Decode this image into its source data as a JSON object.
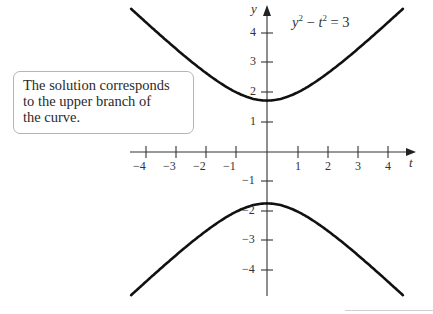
{
  "callout": {
    "lines": [
      "The solution corresponds",
      "to the upper branch of",
      "the curve."
    ]
  },
  "equation": {
    "lhs_var1": "y",
    "exp1": "2",
    "op": " − ",
    "lhs_var2": "t",
    "exp2": "2",
    "rhs": " = 3"
  },
  "axes": {
    "x_label": "t",
    "y_label": "y",
    "x_ticks": [
      "−4",
      "−3",
      "−2",
      "−1",
      "1",
      "2",
      "3",
      "4"
    ],
    "y_ticks": [
      "4",
      "3",
      "2",
      "1",
      "−1",
      "−2",
      "−3",
      "−4"
    ]
  },
  "chart_data": {
    "type": "line",
    "xlabel": "t",
    "ylabel": "y",
    "xlim": [
      -4.5,
      4.5
    ],
    "ylim": [
      -4.8,
      4.8
    ],
    "grid": false,
    "series": [
      {
        "name": "upper branch y = sqrt(3 + t^2)",
        "x": [
          -4.5,
          -4,
          -3,
          -2,
          -1,
          0,
          1,
          2,
          3,
          4,
          4.5
        ],
        "values": [
          4.82,
          4.36,
          3.46,
          2.65,
          2.0,
          1.73,
          2.0,
          2.65,
          3.46,
          4.36,
          4.82
        ]
      },
      {
        "name": "lower branch y = −sqrt(3 + t^2)",
        "x": [
          -4.5,
          -4,
          -3,
          -2,
          -1,
          0,
          1,
          2,
          3,
          4,
          4.5
        ],
        "values": [
          -4.82,
          -4.36,
          -3.46,
          -2.65,
          -2.0,
          -1.73,
          -2.0,
          -2.65,
          -3.46,
          -4.36,
          -4.82
        ]
      }
    ],
    "annotations": [
      "y^2 − t^2 = 3",
      "The solution corresponds to the upper branch of the curve."
    ]
  }
}
